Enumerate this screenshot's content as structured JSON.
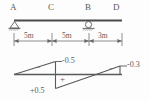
{
  "figure": {
    "units": "m",
    "beam": {
      "nodes": [
        {
          "id": "A",
          "label": "A",
          "x_m": 0,
          "support": "pin"
        },
        {
          "id": "C",
          "label": "C",
          "x_m": 5,
          "support": "none"
        },
        {
          "id": "B",
          "label": "B",
          "x_m": 10,
          "support": "roller"
        },
        {
          "id": "D",
          "label": "D",
          "x_m": 13,
          "support": "none"
        }
      ],
      "dimensions": [
        {
          "label": "5m",
          "from": "A",
          "to": "C",
          "value": 5
        },
        {
          "label": "5m",
          "from": "C",
          "to": "B",
          "value": 5
        },
        {
          "label": "3m",
          "from": "B",
          "to": "D",
          "value": 3
        }
      ]
    },
    "influence_line": {
      "baseline_label": "",
      "ordinates": [
        {
          "at": "A",
          "value": 0,
          "label": ""
        },
        {
          "at": "C",
          "value": -0.5,
          "label": "-0.5",
          "side": "above"
        },
        {
          "at": "C",
          "value": 0.5,
          "label": "+0.5",
          "side": "below"
        },
        {
          "at": "B",
          "value": 0,
          "label": ""
        },
        {
          "at": "D",
          "value": -0.3,
          "label": "-0.3",
          "side": "above"
        }
      ],
      "sign_markers": [
        {
          "label": "−",
          "region": "A-C-upper"
        },
        {
          "label": "+",
          "region": "C-B-lower"
        },
        {
          "label": "−",
          "region": "B-D-upper"
        }
      ]
    },
    "support_symbols": {
      "pin": "pin-support-icon",
      "roller": "roller-support-icon",
      "hatch": "ground-hatch-icon"
    },
    "colors": {
      "line": "#5a5a5a",
      "beam": "#4a4a4a",
      "text": "#5a5a5a",
      "background": "#fdfdfd"
    }
  }
}
